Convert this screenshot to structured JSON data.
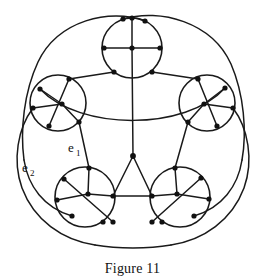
{
  "figure": {
    "caption": "Figure 11",
    "title": "Figure 11",
    "type": "graph-diagram",
    "background_color": "#ffffff",
    "ink_color": "#1a1a1a",
    "vertex_color": "#111111"
  },
  "labels": [
    {
      "id": "e1",
      "base": "e",
      "subscript": "1",
      "x": 70,
      "y": 152,
      "sub_x": 78,
      "sub_y": 156
    },
    {
      "id": "e2",
      "base": "e",
      "subscript": "2",
      "x": 24,
      "y": 172,
      "sub_x": 32,
      "sub_y": 176
    }
  ],
  "graph_data": {
    "type": "planar-graph",
    "description": "Five circular lobes arranged in a pentagon, each lobe containing internal chords and vertices, joined by connecting edges and enclosed by large outer arcs.",
    "lobe_count": 5,
    "lobes": [
      {
        "name": "top",
        "cx": 132,
        "cy": 48,
        "r": 30
      },
      {
        "name": "left",
        "cx": 58,
        "cy": 103,
        "r": 28
      },
      {
        "name": "right",
        "cx": 207,
        "cy": 103,
        "r": 28
      },
      {
        "name": "bottom-left",
        "cx": 85,
        "cy": 197,
        "r": 30
      },
      {
        "name": "bottom-right",
        "cx": 180,
        "cy": 197,
        "r": 30
      }
    ],
    "hub": {
      "x": 133,
      "y": 156
    },
    "outer_arc_count": 5,
    "vertex_count": 41,
    "vertices": [
      {
        "x": 123,
        "y": 19
      },
      {
        "x": 145,
        "y": 21
      },
      {
        "x": 104,
        "y": 48
      },
      {
        "x": 132,
        "y": 48
      },
      {
        "x": 160,
        "y": 48
      },
      {
        "x": 114,
        "y": 72
      },
      {
        "x": 152,
        "y": 72
      },
      {
        "x": 69,
        "y": 79
      },
      {
        "x": 40,
        "y": 89
      },
      {
        "x": 33,
        "y": 108
      },
      {
        "x": 62,
        "y": 104
      },
      {
        "x": 49,
        "y": 126
      },
      {
        "x": 79,
        "y": 122
      },
      {
        "x": 198,
        "y": 79
      },
      {
        "x": 225,
        "y": 88
      },
      {
        "x": 233,
        "y": 108
      },
      {
        "x": 204,
        "y": 104
      },
      {
        "x": 217,
        "y": 126
      },
      {
        "x": 188,
        "y": 122
      },
      {
        "x": 89,
        "y": 168
      },
      {
        "x": 64,
        "y": 179
      },
      {
        "x": 57,
        "y": 200
      },
      {
        "x": 88,
        "y": 194
      },
      {
        "x": 113,
        "y": 196
      },
      {
        "x": 72,
        "y": 216
      },
      {
        "x": 103,
        "y": 222
      },
      {
        "x": 175,
        "y": 168
      },
      {
        "x": 201,
        "y": 178
      },
      {
        "x": 209,
        "y": 199
      },
      {
        "x": 177,
        "y": 194
      },
      {
        "x": 152,
        "y": 196
      },
      {
        "x": 194,
        "y": 216
      },
      {
        "x": 162,
        "y": 222
      },
      {
        "x": 133,
        "y": 156
      }
    ]
  }
}
